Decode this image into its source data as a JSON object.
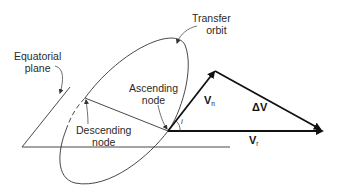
{
  "labels": {
    "equatorial_plane": [
      "Equatorial",
      "plane"
    ],
    "transfer_orbit": [
      "Transfer",
      "orbit"
    ],
    "ascending_node": [
      "Ascending",
      "node"
    ],
    "descending_node": [
      "Descending",
      "node"
    ]
  },
  "vectors": {
    "vn": {
      "symbol": "V",
      "sub": "n"
    },
    "vr": {
      "symbol": "V",
      "sub": "r"
    },
    "dv": {
      "symbol": "ΔV"
    }
  },
  "angle": {
    "symbol": "i"
  },
  "colors": {
    "line": "#222222",
    "background": "#ffffff"
  }
}
